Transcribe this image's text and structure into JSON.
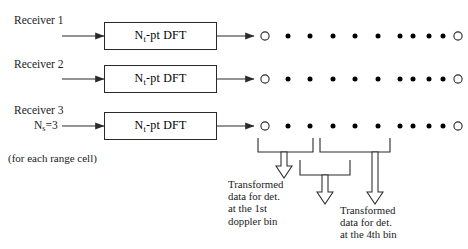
{
  "diagram": {
    "line_color": "#2a2a2a",
    "dot_color": "#000000",
    "receivers": [
      {
        "label": "Receiver 1",
        "box_label_pre": "N",
        "box_label_sub": "t",
        "box_label_post": "-pt DFT"
      },
      {
        "label": "Receiver 2",
        "box_label_pre": "N",
        "box_label_sub": "t",
        "box_label_post": "-pt DFT"
      },
      {
        "label": "Receiver 3",
        "box_label_pre": "N",
        "box_label_sub": "t",
        "box_label_post": "-pt DFT"
      }
    ],
    "ns_label_pre": "N",
    "ns_label_sub": "s",
    "ns_label_post": "=3",
    "range_cell_note": "(for each range cell)",
    "bin_row": {
      "markers": [
        "open",
        "filled",
        "filled",
        "filled",
        "filled",
        "filled",
        "filled",
        "filled",
        "filled",
        "filled",
        "open"
      ],
      "count": 11
    },
    "annotations": [
      {
        "name": "first-doppler-bin",
        "lines": [
          "Transformed",
          "data for det.",
          "at the 1st",
          "doppler bin"
        ]
      },
      {
        "name": "fourth-bin",
        "lines": [
          "Transformed",
          "data for det.",
          "at the 4th bin"
        ]
      }
    ]
  }
}
